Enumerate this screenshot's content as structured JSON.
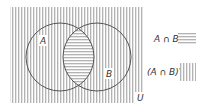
{
  "diagram": {
    "type": "venn",
    "universe_label": "U",
    "sets": [
      {
        "label": "A"
      },
      {
        "label": "B"
      }
    ],
    "shading": {
      "intersection": "horizontal-hatch",
      "complement_of_intersection": "vertical-hatch"
    }
  },
  "legend": {
    "items": [
      {
        "label": "A ∩ B",
        "pattern": "horizontal-hatch"
      },
      {
        "label": "(A ∩ B)′",
        "pattern": "vertical-hatch"
      }
    ]
  },
  "colors": {
    "hatch": "#9a9a9a",
    "outline": "#555555",
    "text": "#333333"
  }
}
